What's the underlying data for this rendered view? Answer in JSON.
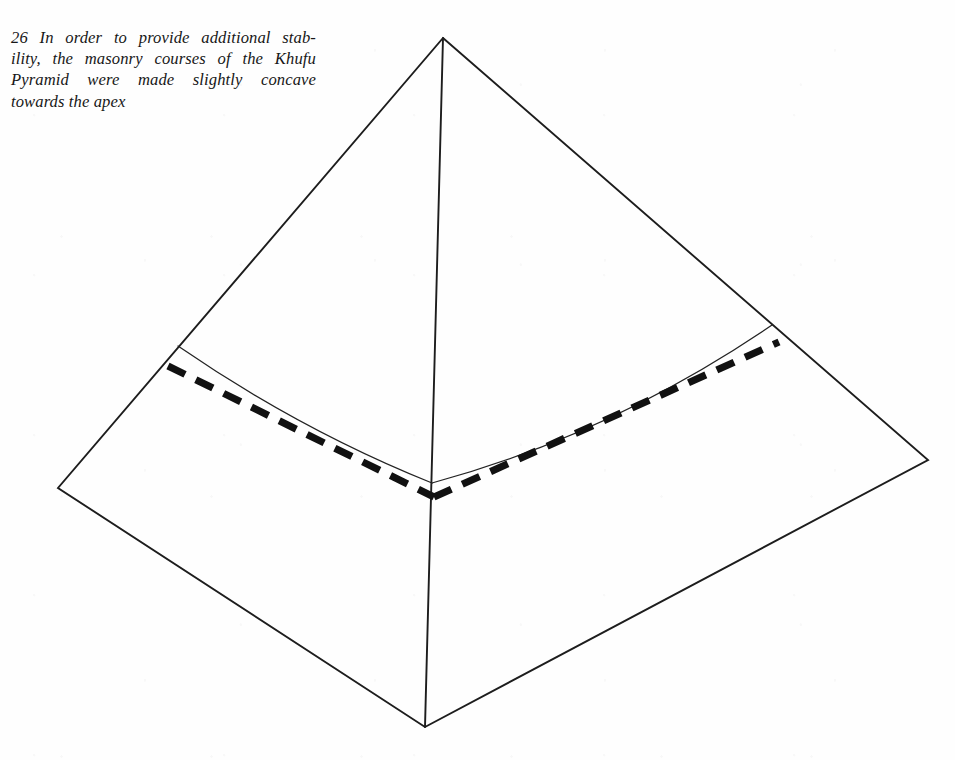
{
  "figure": {
    "number": "26",
    "caption_full": "26 In order to provide additional stability, the masonry courses of the Khufu Pyramid were made slightly concave towards the apex",
    "caption_lines": [
      "26 In order to provide additional stab-",
      "ility, the masonry courses of the Khufu",
      "Pyramid were made slightly concave",
      "towards the apex"
    ],
    "caption_line_words": [
      [
        "26",
        "In",
        "order",
        "to",
        "provide",
        "additional",
        "stab-"
      ],
      [
        "ility,",
        "the",
        "masonry",
        "courses",
        "of",
        "the",
        "Khufu"
      ],
      [
        "Pyramid",
        "were",
        "made",
        "slightly",
        "concave"
      ],
      [
        "towards",
        "the",
        "apex"
      ]
    ],
    "subject": "Khufu Pyramid",
    "background_color": "#fefefe",
    "ink_color": "#1d1d1d"
  },
  "diagram": {
    "type": "line-drawing",
    "elements": [
      {
        "name": "pyramid-outline",
        "description": "three-quarter view square pyramid silhouette",
        "stroke": "#1d1d1d",
        "stroke_width": 1.9,
        "style": "solid"
      },
      {
        "name": "central-vertical-edge",
        "description": "near vertical arris from apex down to front base corner",
        "stroke": "#1d1d1d",
        "stroke_width": 1.9,
        "style": "solid"
      },
      {
        "name": "concave-course-curve",
        "description": "thin solid line showing the masonry course curving concave towards the apex",
        "stroke": "#232323",
        "stroke_width": 1.25,
        "style": "solid"
      },
      {
        "name": "straight-datum-line",
        "description": "heavy dashed line showing a true straight course for comparison",
        "stroke": "#111111",
        "stroke_width": 7.2,
        "style": "dashed"
      }
    ],
    "points": {
      "apex": [
        443,
        38
      ],
      "left_corner": [
        58,
        488
      ],
      "right_corner": [
        928,
        460
      ],
      "front_corner": [
        425,
        727
      ],
      "curve_left_end": [
        178,
        346
      ],
      "curve_center": [
        432,
        483
      ],
      "curve_right_end": [
        772,
        325
      ],
      "dash_left_end": [
        168,
        366
      ],
      "dash_center": [
        434,
        497
      ],
      "dash_right_end": [
        779,
        342
      ]
    }
  }
}
